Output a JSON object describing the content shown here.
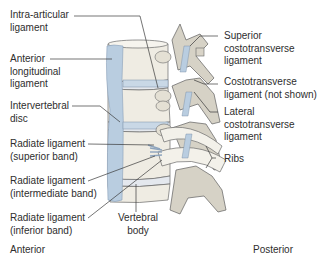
{
  "figure": {
    "labels_left": [
      {
        "id": "intra-articular",
        "lines": [
          "Intra-articular",
          "ligament"
        ]
      },
      {
        "id": "anterior-longitudinal",
        "lines": [
          "Anterior",
          "longitudinal",
          "ligament"
        ]
      },
      {
        "id": "intervertebral-disc",
        "lines": [
          "Intervertebral",
          "disc"
        ]
      },
      {
        "id": "radiate-superior",
        "lines": [
          "Radiate ligament",
          "(superior band)"
        ]
      },
      {
        "id": "radiate-intermediate",
        "lines": [
          "Radiate ligament",
          "(intermediate band)"
        ]
      },
      {
        "id": "radiate-inferior",
        "lines": [
          "Radiate ligament",
          "(inferior band)"
        ]
      }
    ],
    "labels_right": [
      {
        "id": "superior-costotransverse",
        "lines": [
          "Superior",
          "costotransverse",
          "ligament"
        ]
      },
      {
        "id": "costotransverse",
        "lines": [
          "Costotransverse",
          "ligament (not shown)"
        ]
      },
      {
        "id": "lateral-costotransverse",
        "lines": [
          "Lateral",
          "costotransverse",
          "ligament"
        ]
      },
      {
        "id": "ribs",
        "lines": [
          "Ribs"
        ]
      }
    ],
    "labels_bottom": [
      {
        "id": "vertebral-body",
        "lines": [
          "Vertebral",
          "body"
        ]
      }
    ],
    "orientation": {
      "anterior": "Anterior",
      "posterior": "Posterior"
    },
    "colors": {
      "bone": "#efece3",
      "bone_shadow": "#cfc9b8",
      "ligament_blue": "#b9cde0",
      "outline": "#5a5a5a",
      "leader_line": "#3a3a3a",
      "text": "#2e2e2e"
    }
  }
}
